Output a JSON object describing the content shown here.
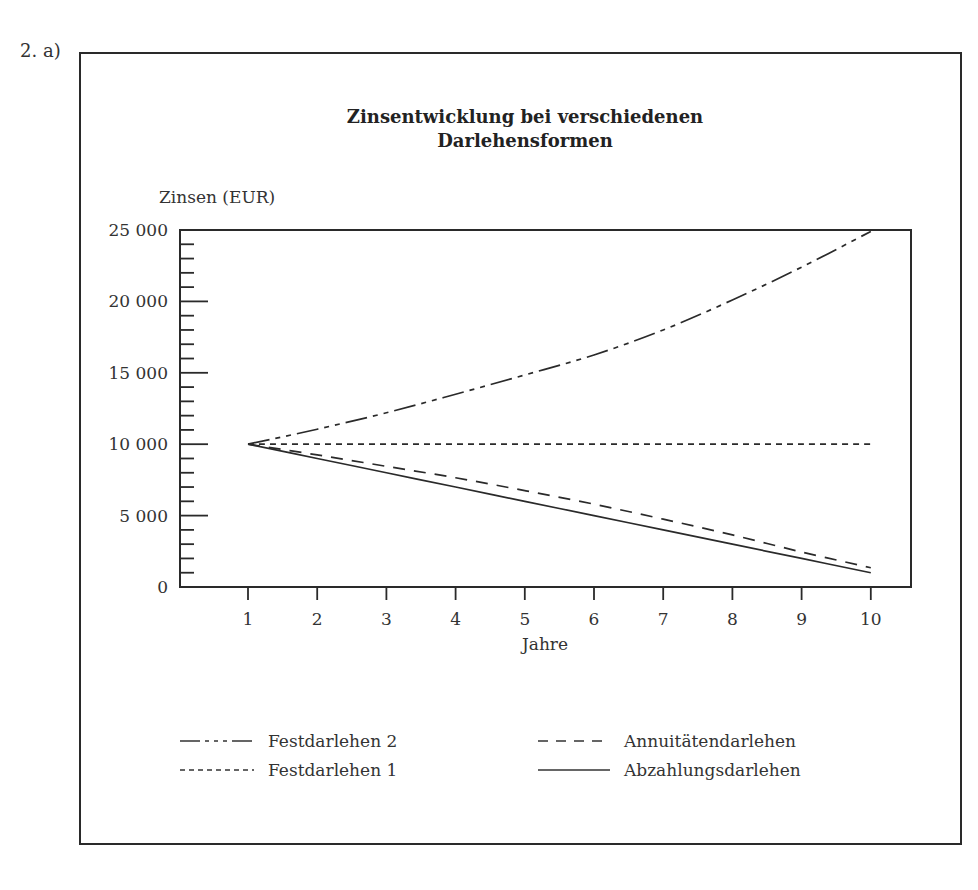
{
  "question_label": "2.  a)",
  "chart_data": {
    "type": "line",
    "title_lines": [
      "Zinsentwicklung bei verschiedenen",
      "Darlehensformen"
    ],
    "xlabel": "Jahre",
    "ylabel": "Zinsen (EUR)",
    "x": [
      1,
      2,
      3,
      4,
      5,
      6,
      7,
      8,
      9,
      10
    ],
    "x_tick_labels": [
      "1",
      "2",
      "3",
      "4",
      "5",
      "6",
      "7",
      "8",
      "9",
      "10"
    ],
    "y_tick_labels": [
      "0",
      "5 000",
      "10 000",
      "15 000",
      "20 000",
      "25 000"
    ],
    "y_ticks": [
      0,
      5000,
      10000,
      15000,
      20000,
      25000
    ],
    "y_minor_tick_step": 1000,
    "ylim": [
      0,
      25000
    ],
    "xlim": [
      0,
      10.6
    ],
    "grid": false,
    "legend_position": "bottom",
    "series": [
      {
        "name": "Festdarlehen 2",
        "style": "dash-dot-dot",
        "values": [
          10000,
          11050,
          12200,
          13500,
          14850,
          16250,
          18000,
          20100,
          22400,
          24900
        ]
      },
      {
        "name": "Festdarlehen 1",
        "style": "short-dash",
        "values": [
          10000,
          10000,
          10000,
          10000,
          10000,
          10000,
          10000,
          10000,
          10000,
          10000
        ]
      },
      {
        "name": "Annuitätendarlehen",
        "style": "long-dash",
        "values": [
          10000,
          9250,
          8450,
          7650,
          6750,
          5800,
          4750,
          3650,
          2450,
          1350
        ]
      },
      {
        "name": "Abzahlungsdarlehen",
        "style": "solid",
        "values": [
          10000,
          9000,
          8000,
          7000,
          6000,
          5000,
          4000,
          3000,
          2000,
          1000
        ]
      }
    ]
  },
  "legend": {
    "items": [
      {
        "label": "Festdarlehen 2"
      },
      {
        "label": "Festdarlehen 1"
      },
      {
        "label": "Annuitätendarlehen"
      },
      {
        "label": "Abzahlungsdarlehen"
      }
    ]
  },
  "colors": {
    "ink": "#2a2a2a",
    "background": "#ffffff"
  }
}
